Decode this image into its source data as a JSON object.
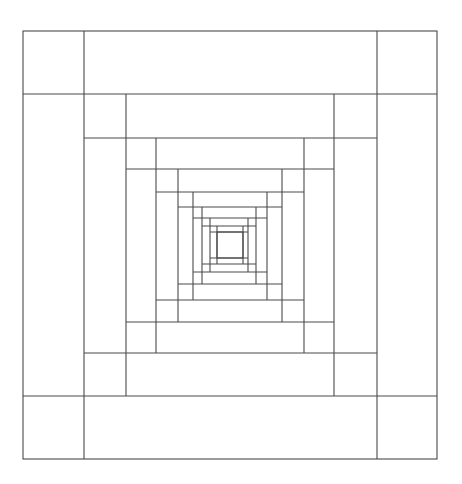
{
  "diagram": {
    "type": "nested-log-cabin-squares",
    "stroke_color": "#4a4a4a",
    "background": "#ffffff",
    "outer_square": [
      23,
      31,
      437,
      459
    ],
    "levels": [
      {
        "square": [
          23,
          31,
          437,
          459
        ],
        "vx": [
          84,
          377
        ],
        "hy": [
          94,
          396
        ]
      },
      {
        "square": [
          84,
          94,
          377,
          396
        ],
        "vx": [
          126,
          334
        ],
        "hy": [
          138,
          353
        ]
      },
      {
        "square": [
          126,
          138,
          334,
          353
        ],
        "vx": [
          156,
          304
        ],
        "hy": [
          169,
          322
        ]
      },
      {
        "square": [
          156,
          169,
          304,
          322
        ],
        "vx": [
          178,
          282
        ],
        "hy": [
          192,
          300
        ]
      },
      {
        "square": [
          178,
          192,
          282,
          300
        ],
        "vx": [
          193,
          267
        ],
        "hy": [
          207,
          284
        ]
      },
      {
        "square": [
          193,
          207,
          267,
          284
        ],
        "vx": [
          202,
          256
        ],
        "hy": [
          218,
          272
        ]
      },
      {
        "square": [
          202,
          218,
          256,
          272
        ],
        "vx": [
          210,
          248
        ],
        "hy": [
          226,
          264
        ]
      },
      {
        "square": [
          210,
          226,
          248,
          264
        ],
        "vx": [
          217,
          243
        ],
        "hy": [
          232,
          258
        ]
      }
    ],
    "innermost_square": [
      217,
      232,
      243,
      258
    ]
  }
}
